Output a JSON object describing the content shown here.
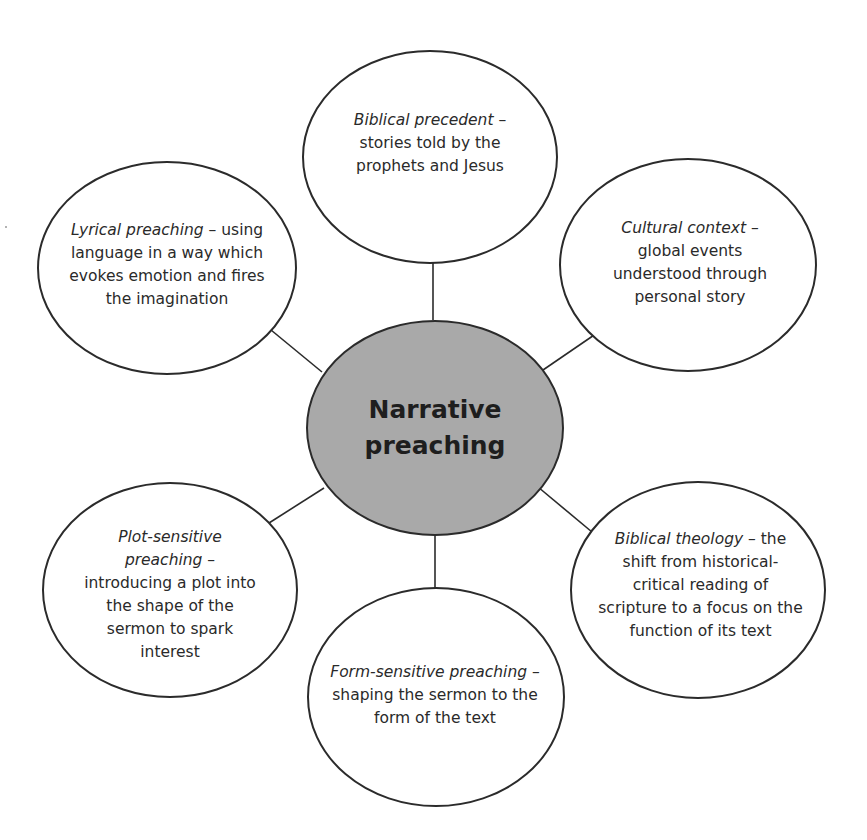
{
  "diagram": {
    "type": "mind-map",
    "colors": {
      "background": "#ffffff",
      "outline": "#2b2b2b",
      "center_fill": "#a9a9a9",
      "text": "#2a2a2a"
    },
    "center": {
      "line1": "Narrative",
      "line2": "preaching"
    },
    "nodes": [
      {
        "id": "biblical-precedent",
        "position": "top",
        "title": "Biblical precedent",
        "separator": " –",
        "description": "stories told by the prophets and Jesus"
      },
      {
        "id": "cultural-context",
        "position": "upper-right",
        "title": "Cultural context",
        "separator": " –",
        "description": "global events understood through personal story"
      },
      {
        "id": "biblical-theology",
        "position": "lower-right",
        "title": "Biblical theology",
        "separator": " –",
        "description": "the shift from historical-critical reading of scripture to a focus on the function of its text"
      },
      {
        "id": "form-sensitive-preaching",
        "position": "bottom",
        "title": "Form-sensitive preaching",
        "separator": " –",
        "description": "shaping the sermon to the form of the text"
      },
      {
        "id": "plot-sensitive-preaching",
        "position": "lower-left",
        "title": "Plot-sensitive preaching",
        "separator": " –",
        "description": "introducing a plot into the shape of the sermon to spark interest"
      },
      {
        "id": "lyrical-preaching",
        "position": "upper-left",
        "title": "Lyrical preaching",
        "separator": " –",
        "description": "using language in a way which evokes emotion and fires the imagination"
      }
    ]
  }
}
